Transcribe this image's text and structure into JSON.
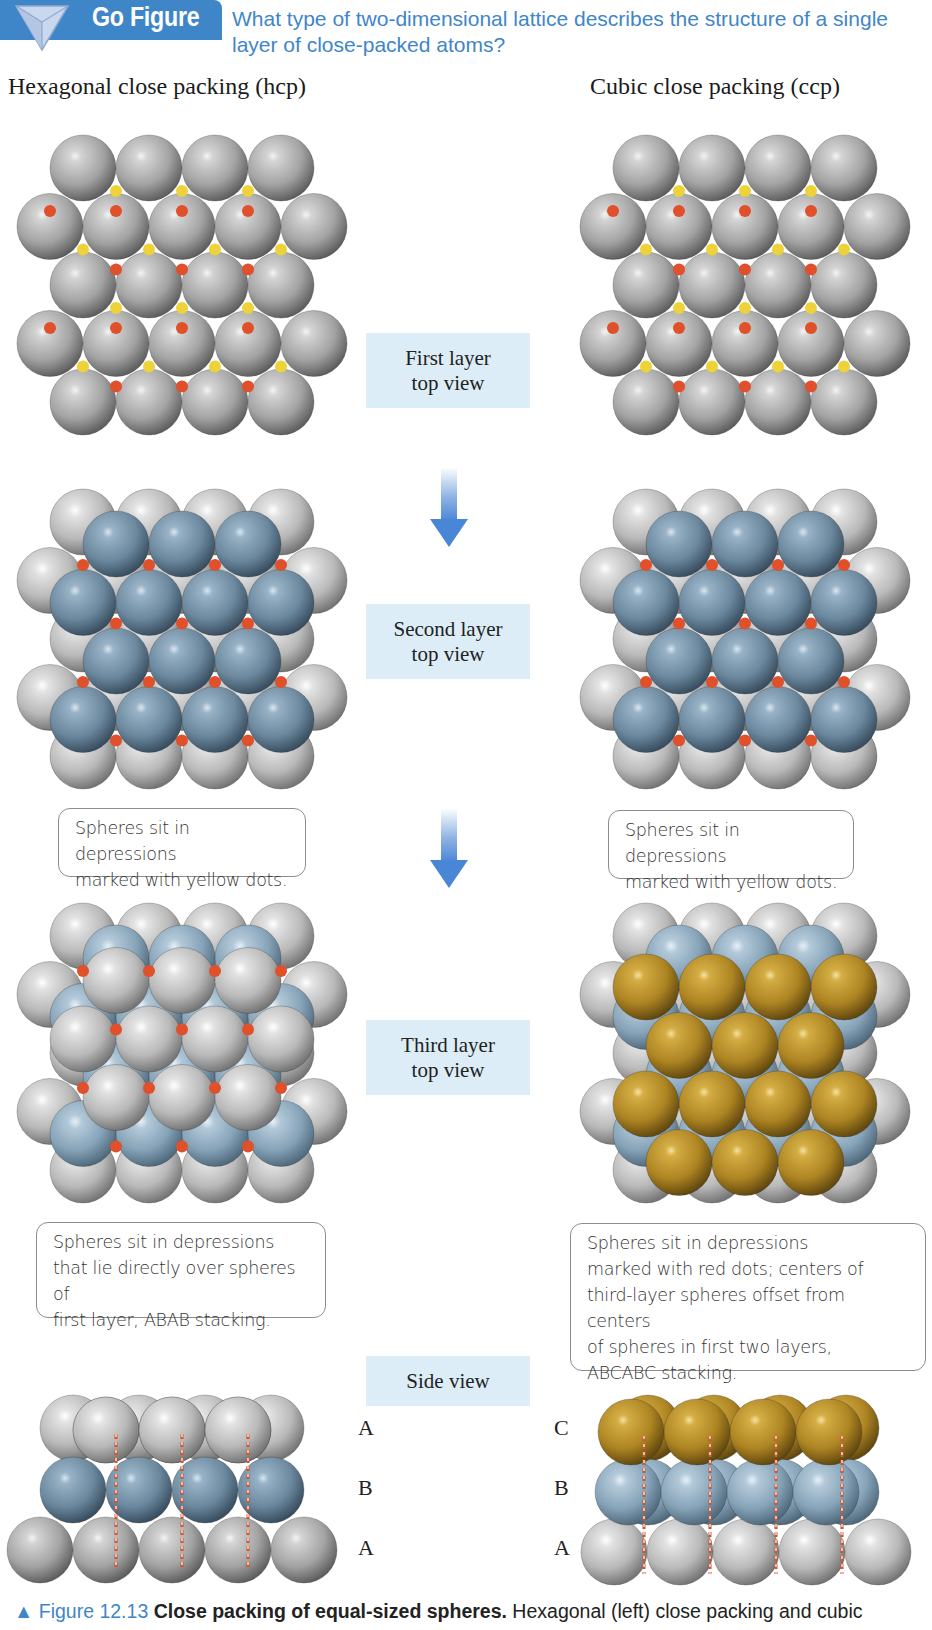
{
  "header": {
    "badge_label": "Go Figure",
    "badge_icon": "triangle-down-icon",
    "question": "What type of two-dimensional lattice describes the structure of a single layer of close-packed atoms?"
  },
  "columns": {
    "left_title": "Hexagonal close packing (hcp)",
    "right_title": "Cubic close packing (ccp)"
  },
  "stages": {
    "first": {
      "line1": "First layer",
      "line2": "top view"
    },
    "second": {
      "line1": "Second layer",
      "line2": "top view"
    },
    "third": {
      "line1": "Third layer",
      "line2": "top view"
    },
    "side": {
      "label": "Side view"
    }
  },
  "callouts": {
    "hcp_second": [
      "Spheres sit in depressions",
      "marked with yellow dots."
    ],
    "ccp_second": [
      "Spheres sit in depressions",
      "marked with yellow dots."
    ],
    "hcp_third": [
      "Spheres sit in depressions",
      "that lie directly over spheres of",
      "first layer, ABAB stacking."
    ],
    "ccp_third": [
      "Spheres sit in depressions",
      "marked with red dots; centers of",
      "third-layer spheres offset from centers",
      "of spheres in first two layers,",
      "ABCABC stacking."
    ]
  },
  "side_view": {
    "hcp_letters": [
      "A",
      "B",
      "A"
    ],
    "ccp_letters": [
      "C",
      "B",
      "A"
    ]
  },
  "caption": {
    "marker": "▲",
    "figure_number": "Figure 12.13",
    "title": "Close packing of equal-sized spheres.",
    "text": "Hexagonal (left) close packing and cubic"
  },
  "colors": {
    "accent_blue": "#3f86c8",
    "label_bg": "#dcedf7",
    "sphere_gray": "#9a9a9a",
    "sphere_blue": "#6f8fa6",
    "sphere_gold": "#b8922a",
    "dot_red": "#e0502a",
    "dot_yellow": "#eed23a"
  }
}
